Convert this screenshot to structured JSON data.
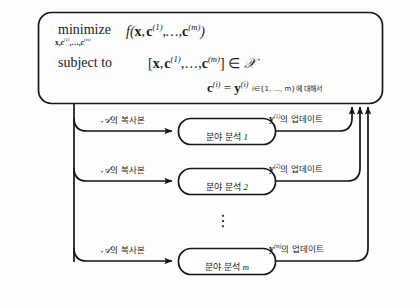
{
  "diagram": {
    "title_block": {
      "minimize_label": "minimize",
      "minimize_subscript": "x,c(1),...,c(m)",
      "objective": "f(x, c(1),...,c(m))",
      "subject_to_label": "subject to",
      "constraint_membership": "[x, c(1),...,c(m)] ∈ X",
      "constraint_equality": "c(i) = y(i)",
      "constraint_range": "i∈{1, ..., m}에 대해서"
    },
    "rows": [
      {
        "input_label": "𝒜의 복사본",
        "node_label": "분야 분석 1",
        "output_label": "y(1)의 업데이트",
        "node_index": "1",
        "superscript": "(1)"
      },
      {
        "input_label": "𝒜의 복사본",
        "node_label": "분야 분석 2",
        "output_label": "y(2)의 업데이트",
        "node_index": "2",
        "superscript": "(2)"
      },
      {
        "input_label": "𝒜의 복사본",
        "node_label": "분야 분석 m",
        "output_label": "y(m)의 업데이트",
        "node_index": "m",
        "superscript": "(m)"
      }
    ],
    "ellipsis": "⋮",
    "colors": {
      "stroke": "#151515",
      "text": "#1b1b1b",
      "background": "#fdfdfd"
    }
  }
}
